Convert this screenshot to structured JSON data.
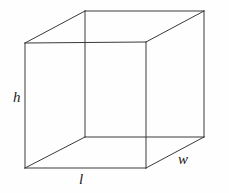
{
  "figure": {
    "name": "rectangular-prism-diagram",
    "background_color": "#fefefe",
    "edge_color": "#3a3a3a",
    "label_color": "#1a1a1a",
    "labels": {
      "height": "h",
      "length": "l",
      "width": "w"
    },
    "vertices": {
      "front_top_left": [
        25,
        43
      ],
      "front_top_right": [
        146,
        42
      ],
      "front_bottom_right": [
        146,
        168
      ],
      "front_bottom_left": [
        25,
        168
      ],
      "back_top_left": [
        85,
        11
      ],
      "back_top_right": [
        204,
        11
      ],
      "back_bottom_right": [
        204,
        137
      ],
      "back_bottom_left": [
        85,
        137
      ]
    }
  }
}
